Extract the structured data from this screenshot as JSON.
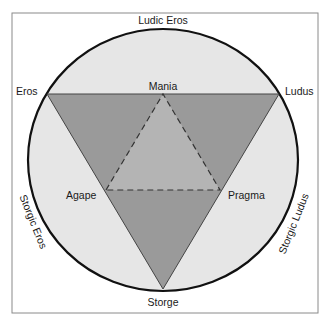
{
  "diagram": {
    "colors": {
      "frame": "#8a8a8a",
      "circle_fill": "#e6e6e6",
      "circle_stroke": "#111111",
      "outer_triangle_fill": "#9a9a9a",
      "inner_triangle_fill": "#b4b4b4",
      "triangle_stroke": "#444444"
    },
    "labels": {
      "top": "Ludic Eros",
      "eros": "Eros",
      "ludus": "Ludus",
      "mania": "Mania",
      "agape": "Agape",
      "pragma": "Pragma",
      "storge": "Storge",
      "storgic_eros": "Storgic Eros",
      "storgic_ludus": "Storgic Ludus"
    }
  }
}
